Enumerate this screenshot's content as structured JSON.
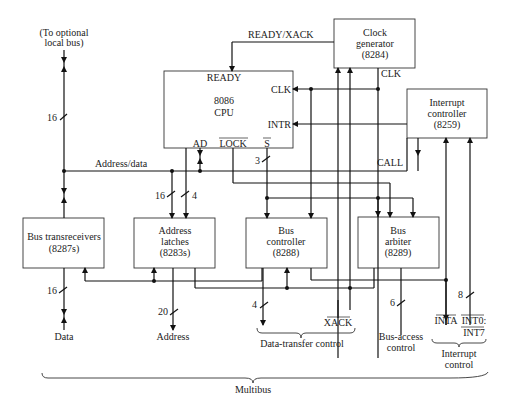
{
  "diagram": {
    "blocks": {
      "cpu": {
        "line1": "8086",
        "line2": "CPU",
        "pins": {
          "ready": "READY",
          "clk": "CLK",
          "intr": "INTR",
          "ad": "AD",
          "lock": "LOCK",
          "s": "S"
        }
      },
      "clock_generator": {
        "line1": "Clock",
        "line2": "generator",
        "line3": "(8284)"
      },
      "interrupt_controller": {
        "line1": "Interrupt",
        "line2": "controller",
        "line3": "(8259)"
      },
      "bus_transceivers": {
        "line1": "Bus transreceivers",
        "line2": "(8287s)"
      },
      "address_latches": {
        "line1": "Address",
        "line2": "latches",
        "line3": "(8283s)"
      },
      "bus_controller": {
        "line1": "Bus",
        "line2": "controller",
        "line3": "(8288)"
      },
      "bus_arbiter": {
        "line1": "Bus",
        "line2": "arbiter",
        "line3": "(8289)"
      }
    },
    "labels": {
      "local_bus_1": "(To optional",
      "local_bus_2": "local bus)",
      "ready_xack": "READY/XACK",
      "clk_out": "CLK",
      "address_data": "Address/data",
      "call": "CALL",
      "data": "Data",
      "address": "Address",
      "xack": "XACK",
      "data_transfer_control": "Data-transfer control",
      "bus_access_1": "Bus-access",
      "bus_access_2": "control",
      "inta": "INTA",
      "int0": "INT0:",
      "int7": "INT7",
      "interrupt_control_1": "Interrupt",
      "interrupt_control_2": "control",
      "multibus": "Multibus"
    },
    "bus_widths": {
      "local_bus": "16",
      "latch_in_ad": "16",
      "latch_in_s": "4",
      "status": "3",
      "data": "16",
      "address": "20",
      "transfer": "4",
      "bus_access": "6",
      "interrupts": "8"
    }
  }
}
